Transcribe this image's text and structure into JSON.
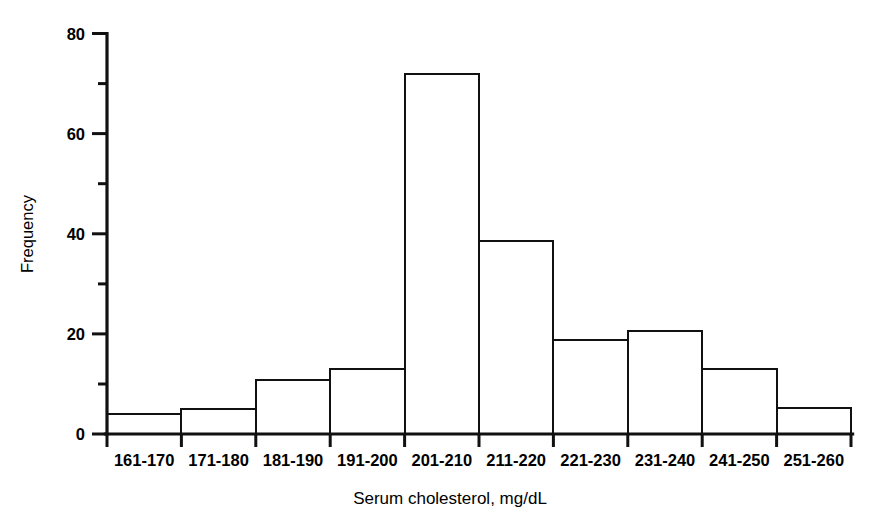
{
  "chart_data": {
    "type": "bar",
    "title": "",
    "subtitle": "",
    "xlabel": "Serum cholesterol, mg/dL",
    "ylabel": "Frequency",
    "categories": [
      "161-170",
      "171-180",
      "181-190",
      "191-200",
      "201-210",
      "211-220",
      "221-230",
      "231-240",
      "241-250",
      "251-260"
    ],
    "values": [
      4,
      5,
      10.7,
      13,
      72,
      38.5,
      18.8,
      20.5,
      13,
      5.2
    ],
    "ylim": [
      0,
      80
    ],
    "y_major_ticks": [
      0,
      20,
      40,
      60,
      80
    ],
    "y_major_tick_labels": [
      "0",
      "20",
      "40",
      "60",
      "80"
    ],
    "y_minor_ticks": [
      10,
      30,
      50,
      70
    ],
    "grid": false,
    "legend": null,
    "bar_style": "outline",
    "annotations": []
  },
  "axes": {
    "y_title": "Frequency",
    "x_title": "Serum cholesterol, mg/dL"
  },
  "y_tick_labels": {
    "t0": "0",
    "t20": "20",
    "t40": "40",
    "t60": "60",
    "t80": "80"
  },
  "x_tick_labels": {
    "b0": "161-170",
    "b1": "171-180",
    "b2": "181-190",
    "b3": "191-200",
    "b4": "201-210",
    "b5": "211-220",
    "b6": "221-230",
    "b7": "231-240",
    "b8": "241-250",
    "b9": "251-260"
  },
  "colors": {
    "ink": "#111111",
    "background": "#ffffff"
  }
}
